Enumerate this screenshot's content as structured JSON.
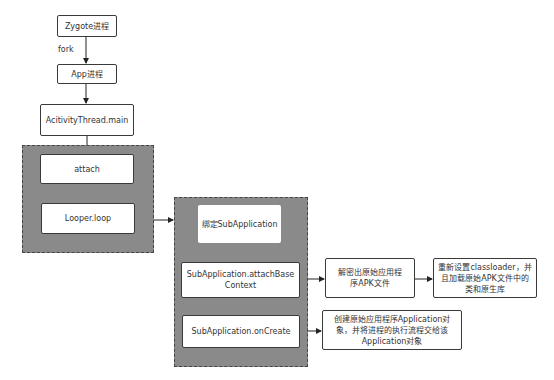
{
  "diagram": {
    "top_cut_text": "...",
    "nodes": {
      "zygote": "Zygote进程",
      "fork_label": "fork",
      "app": "App进程",
      "activity_thread": "AcitivityThread.main",
      "attach": "attach",
      "looper": "Looper.loop",
      "bind_sub": "绑定SubApplication",
      "attach_base_context": "SubApplication.attachBaseContext",
      "on_create": "SubApplication.onCreate",
      "decrypt": "解密出原始应用程序APK文件",
      "reset_classloader": "重新设置classloader，并且加载原始APK文件中的类和原生库",
      "create_app": "创建原始应用程序Application对象，并将进程的执行流程交给该Application对象"
    },
    "edges": [
      {
        "from": "zygote",
        "to": "app",
        "label": "fork"
      },
      {
        "from": "app",
        "to": "activity_thread"
      },
      {
        "from": "activity_thread",
        "to": "attach"
      },
      {
        "from": "attach",
        "to": "looper"
      },
      {
        "from": "left_group",
        "to": "right_group"
      },
      {
        "from": "bind_sub",
        "to": "attach_base_context"
      },
      {
        "from": "attach_base_context",
        "to": "on_create"
      },
      {
        "from": "attach_base_context",
        "to": "decrypt"
      },
      {
        "from": "decrypt",
        "to": "reset_classloader"
      },
      {
        "from": "on_create",
        "to": "create_app"
      }
    ],
    "colors": {
      "group_fill": "#8a8a8a",
      "group_border": "#444444",
      "box_fill": "#ffffff",
      "box_border": "#3a3a3a"
    }
  }
}
